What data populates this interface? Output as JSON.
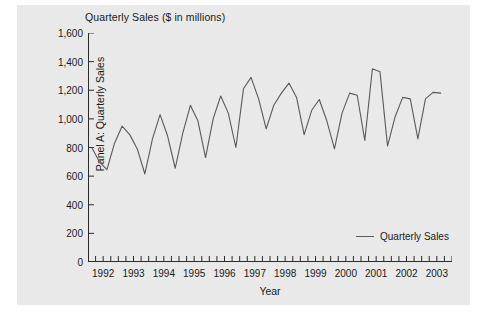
{
  "figure": {
    "panel_background": "#e9e9e9",
    "page_background": "#ffffff"
  },
  "chart_data": {
    "type": "line",
    "title": "Quarterly Sales ($ in millions)",
    "xlabel": "Year",
    "ylabel": "Panel A: Quarterly Sales",
    "ylim": [
      0,
      1600
    ],
    "xlim": [
      1992.0,
      2003.75
    ],
    "grid": false,
    "legend_position": "bottom-right",
    "line_color": "#5a5a5a",
    "ytick_values": [
      0,
      200,
      400,
      600,
      800,
      1000,
      1200,
      1400,
      1600
    ],
    "ytick_labels": [
      "0",
      "200",
      "400",
      "600",
      "800",
      "1,000",
      "1,200",
      "1,400",
      "1,600"
    ],
    "xtick_labels": [
      "1992",
      "1993",
      "1994",
      "1995",
      "1996",
      "1997",
      "1998",
      "1999",
      "2000",
      "2001",
      "2002",
      "2003"
    ],
    "minor_ticks_per_year": 4,
    "series": [
      {
        "name": "Quarterly Sales",
        "x": [
          "1992Q1",
          "1992Q2",
          "1992Q3",
          "1992Q4",
          "1993Q1",
          "1993Q2",
          "1993Q3",
          "1993Q4",
          "1994Q1",
          "1994Q2",
          "1994Q3",
          "1994Q4",
          "1995Q1",
          "1995Q2",
          "1995Q3",
          "1995Q4",
          "1996Q1",
          "1996Q2",
          "1996Q3",
          "1996Q4",
          "1997Q1",
          "1997Q2",
          "1997Q3",
          "1997Q4",
          "1998Q1",
          "1998Q2",
          "1998Q3",
          "1998Q4",
          "1999Q1",
          "1999Q2",
          "1999Q3",
          "1999Q4",
          "2000Q1",
          "2000Q2",
          "2000Q3",
          "2000Q4",
          "2001Q1",
          "2001Q2",
          "2001Q3",
          "2001Q4",
          "2002Q1",
          "2002Q2",
          "2002Q3",
          "2002Q4",
          "2003Q1",
          "2003Q2",
          "2003Q3"
        ],
        "values": [
          800,
          700,
          645,
          830,
          950,
          890,
          790,
          615,
          860,
          1030,
          880,
          655,
          900,
          1095,
          985,
          730,
          1000,
          1160,
          1040,
          800,
          1210,
          1290,
          1140,
          930,
          1095,
          1180,
          1250,
          1150,
          890,
          1060,
          1135,
          985,
          790,
          1040,
          1180,
          1165,
          850,
          1350,
          1330,
          810,
          1015,
          1150,
          1140,
          860,
          1140,
          1185,
          1180
        ]
      }
    ]
  },
  "legend": {
    "label": "Quarterly Sales"
  }
}
